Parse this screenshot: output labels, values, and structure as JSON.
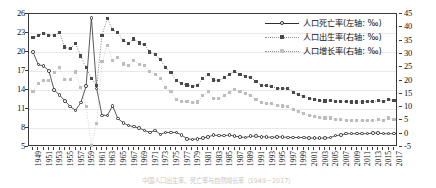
{
  "chart_data": {
    "type": "line",
    "title": "",
    "subtitle": "",
    "xlabel": "",
    "ylabel": "",
    "ylabel_right": "",
    "grid": true,
    "legend_position": "top-right",
    "axes": {
      "left": {
        "ticks": [
          26,
          23,
          20,
          17,
          14,
          11,
          8,
          5
        ],
        "min": 5,
        "max": 26,
        "unit": "‰"
      },
      "right": {
        "ticks": [
          45,
          40,
          35,
          30,
          25,
          20,
          15,
          10,
          5,
          0,
          -5
        ],
        "min": -5,
        "max": 45,
        "unit": "‰"
      }
    },
    "x": [
      1949,
      1950,
      1951,
      1952,
      1953,
      1954,
      1955,
      1956,
      1957,
      1958,
      1959,
      1960,
      1961,
      1962,
      1963,
      1964,
      1965,
      1966,
      1967,
      1968,
      1969,
      1970,
      1971,
      1972,
      1973,
      1974,
      1975,
      1976,
      1977,
      1978,
      1979,
      1980,
      1981,
      1982,
      1983,
      1984,
      1985,
      1986,
      1987,
      1988,
      1989,
      1990,
      1991,
      1992,
      1993,
      1994,
      1995,
      1996,
      1997,
      1998,
      1999,
      2000,
      2001,
      2002,
      2003,
      2004,
      2005,
      2006,
      2007,
      2008,
      2009,
      2010,
      2011,
      2012,
      2013,
      2014,
      2015,
      2016,
      2017
    ],
    "xtick_labels": [
      1949,
      1951,
      1953,
      1955,
      1957,
      1959,
      1961,
      1963,
      1965,
      1967,
      1969,
      1971,
      1973,
      1975,
      1977,
      1979,
      1981,
      1983,
      1985,
      1987,
      1989,
      1991,
      1993,
      1995,
      1997,
      1999,
      2001,
      2003,
      2005,
      2007,
      2009,
      2011,
      2013,
      2015,
      2017
    ],
    "series": [
      {
        "name": "人口死亡率(左轴: ‰)",
        "axis": "left",
        "style": "solid-line-open-circle",
        "color": "#2f2f2f",
        "values": [
          20.0,
          18.0,
          17.8,
          17.0,
          14.0,
          13.2,
          12.3,
          11.4,
          10.8,
          12.0,
          14.6,
          25.4,
          14.2,
          10.0,
          10.0,
          11.5,
          9.5,
          8.8,
          8.4,
          8.2,
          8.0,
          7.6,
          7.3,
          7.6,
          7.0,
          7.3,
          7.3,
          7.3,
          6.9,
          6.3,
          6.2,
          6.3,
          6.4,
          6.6,
          6.9,
          6.8,
          6.8,
          6.9,
          6.7,
          6.6,
          6.5,
          6.7,
          6.7,
          6.6,
          6.6,
          6.5,
          6.6,
          6.6,
          6.5,
          6.5,
          6.5,
          6.5,
          6.4,
          6.4,
          6.4,
          6.4,
          6.5,
          6.8,
          6.9,
          7.1,
          7.1,
          7.1,
          7.1,
          7.1,
          7.2,
          7.2,
          7.1,
          7.1,
          7.1
        ]
      },
      {
        "name": "人口出生率(右轴: ‰)",
        "axis": "right",
        "style": "dotted-line-dark-square",
        "color": "#4a4a4a",
        "values": [
          36.0,
          37.0,
          37.8,
          37.0,
          37.0,
          37.9,
          32.6,
          31.9,
          34.0,
          29.2,
          24.8,
          20.9,
          18.0,
          37.0,
          43.4,
          39.1,
          38.0,
          35.1,
          34.0,
          35.6,
          34.1,
          33.4,
          30.7,
          29.8,
          27.9,
          24.8,
          23.0,
          19.9,
          18.9,
          18.3,
          17.8,
          18.2,
          20.9,
          22.3,
          20.2,
          19.9,
          21.0,
          22.4,
          23.3,
          22.4,
          21.6,
          21.1,
          19.7,
          18.2,
          18.1,
          17.7,
          17.1,
          17.0,
          17.0,
          15.6,
          14.6,
          14.0,
          13.4,
          12.9,
          12.4,
          12.3,
          12.4,
          12.1,
          12.1,
          12.1,
          11.9,
          11.9,
          11.9,
          12.1,
          12.1,
          12.4,
          12.1,
          12.9,
          12.4
        ]
      },
      {
        "name": "人口增长率(右轴: ‰)",
        "axis": "right",
        "style": "dotted-line-light-square",
        "color": "#c2c2c2",
        "values": [
          16.0,
          19.0,
          20.0,
          20.0,
          23.0,
          24.8,
          20.3,
          20.5,
          23.2,
          17.2,
          10.2,
          -4.6,
          3.8,
          27.0,
          33.3,
          27.6,
          28.5,
          26.2,
          25.5,
          27.4,
          26.1,
          25.8,
          23.3,
          22.2,
          20.9,
          17.5,
          15.7,
          12.7,
          12.1,
          12.0,
          11.6,
          11.9,
          14.5,
          15.7,
          13.3,
          13.1,
          14.3,
          15.6,
          16.6,
          15.7,
          15.0,
          14.4,
          13.0,
          11.6,
          11.5,
          11.2,
          10.6,
          10.4,
          10.1,
          9.1,
          8.2,
          7.6,
          7.0,
          6.5,
          6.0,
          5.9,
          5.9,
          5.3,
          5.2,
          5.1,
          4.9,
          4.8,
          4.8,
          5.0,
          4.9,
          5.2,
          5.0,
          5.9,
          5.3
        ]
      }
    ]
  },
  "legend": {
    "items": [
      {
        "label": "人口死亡率(左轴: ‰)",
        "marker": "open-circle-solid-line"
      },
      {
        "label": "人口出生率(右轴: ‰)",
        "marker": "dark-square-dotted-line"
      },
      {
        "label": "人口增长率(右轴: ‰)",
        "marker": "light-square-dotted-line"
      }
    ]
  },
  "caption": {
    "text": "中国人口出生率、死亡率与自然增长率（1949－2017）"
  }
}
